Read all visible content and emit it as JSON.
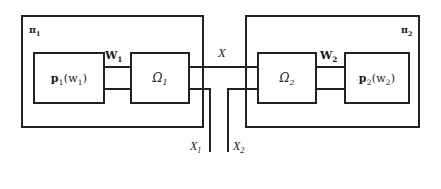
{
  "diagram": {
    "background_color": "#ffffff",
    "line_color": "#222222",
    "groups": [
      {
        "id": "pi1",
        "label": "π1",
        "label_base": "π",
        "label_sub": "1",
        "blocks": [
          {
            "id": "p1",
            "label_base": "p",
            "label_sub": "1",
            "label_arg": "(w",
            "label_arg_sub": "1",
            "label_arg_close": ")",
            "label": "p1(w1)"
          },
          {
            "id": "omega1",
            "label_base": "Ω",
            "label_sub": "1",
            "label": "Ω1"
          }
        ],
        "bus_label": "W1",
        "bus_label_base": "W",
        "bus_label_sub": "1"
      },
      {
        "id": "pi2",
        "label": "π2",
        "label_base": "π",
        "label_sub": "2",
        "blocks": [
          {
            "id": "omega2",
            "label_base": "Ω",
            "label_sub": "2",
            "label": "Ω2"
          },
          {
            "id": "p2",
            "label_base": "p",
            "label_sub": "2",
            "label_arg": "(w",
            "label_arg_sub": "2",
            "label_arg_close": ")",
            "label": "p2(w2)"
          }
        ],
        "bus_label": "W2",
        "bus_label_base": "W",
        "bus_label_sub": "2"
      }
    ],
    "signals": [
      {
        "id": "x",
        "label": "X",
        "label_base": "X",
        "label_sub": ""
      },
      {
        "id": "x1",
        "label": "X1",
        "label_base": "X",
        "label_sub": "1"
      },
      {
        "id": "x2",
        "label": "X2",
        "label_base": "X",
        "label_sub": "2"
      }
    ]
  }
}
